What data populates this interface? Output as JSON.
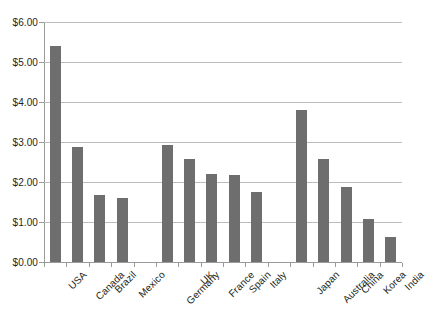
{
  "chart_data": {
    "type": "bar",
    "title": "",
    "subtitle": "",
    "xlabel": "",
    "ylabel": "",
    "ylim": [
      0,
      6
    ],
    "ytick_values": [
      0,
      1,
      2,
      3,
      4,
      5,
      6
    ],
    "ytick_labels": [
      "$0.00",
      "$1.00",
      "$2.00",
      "$3.00",
      "$4.00",
      "$5.00",
      "$6.00"
    ],
    "grid": true,
    "legend": false,
    "legend_position": "none",
    "bar_color": "#6e6e6e",
    "gridline_color": "#bcbcbc",
    "axis_color": "#9a9a9a",
    "background_color": "#ffffff",
    "categories": [
      "USA",
      "Canada",
      "Brazil",
      "Mexico",
      "",
      "Germany",
      "UK",
      "France",
      "Spain",
      "Italy",
      "",
      "Japan",
      "Australia",
      "China",
      "Korea",
      "India"
    ],
    "values": [
      5.4,
      2.88,
      1.68,
      1.6,
      null,
      2.92,
      2.58,
      2.2,
      2.18,
      1.76,
      null,
      3.8,
      2.58,
      1.88,
      1.08,
      0.62
    ],
    "groups": [
      {
        "name": "Americas",
        "members": [
          "USA",
          "Canada",
          "Brazil",
          "Mexico"
        ]
      },
      {
        "name": "Europe",
        "members": [
          "Germany",
          "UK",
          "France",
          "Spain",
          "Italy"
        ]
      },
      {
        "name": "Asia-Pacific",
        "members": [
          "Japan",
          "Australia",
          "China",
          "Korea",
          "India"
        ]
      }
    ]
  }
}
